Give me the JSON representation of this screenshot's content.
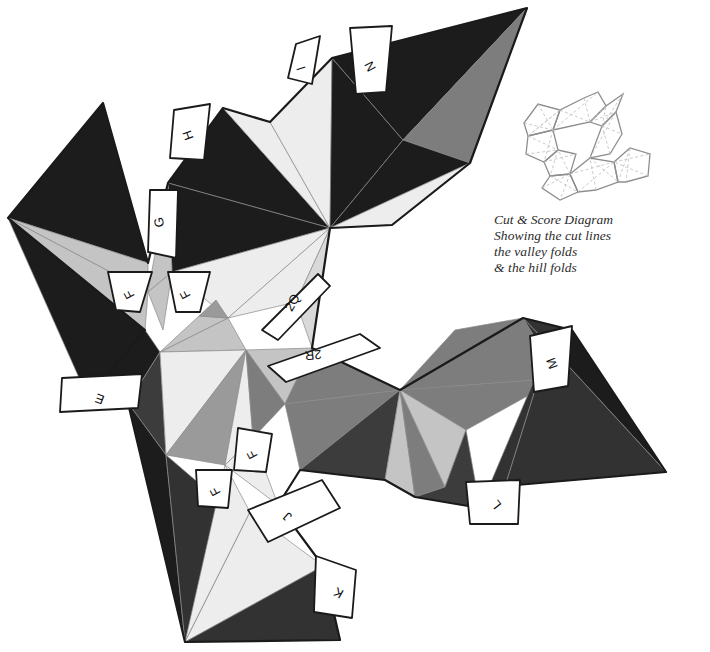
{
  "document": {
    "kind": "papercraft-net",
    "title": "Cut & Score Diagram"
  },
  "legend": {
    "title": "Cut & Score Diagram",
    "rows": [
      {
        "label": "Showing the cut lines",
        "rule": "solid-dark"
      },
      {
        "label": "the valley folds",
        "rule": "dashed-light"
      },
      {
        "label": "& the hill folds",
        "rule": "solid-light"
      }
    ]
  },
  "thumbnail": {
    "name": "mini-net-preview",
    "caption": ""
  },
  "palette": {
    "black": "#1c1c1c",
    "dark": "#323232",
    "darkgray": "#3c3c3c",
    "mid": "#7d7d7d",
    "midlight": "#9a9a9a",
    "light": "#c4c4c4",
    "lighter": "#d9d9d9",
    "paleer": "#ededed",
    "white": "#ffffff",
    "stroke_cut": "#1a1a1a",
    "stroke_fold": "#6e6e6e",
    "stroke_thin": "#8a8a8a",
    "text": "#111111"
  },
  "tabs": [
    {
      "id": "tab-i",
      "label": "I",
      "x": 302,
      "y": 68,
      "rot": -108
    },
    {
      "id": "tab-n",
      "label": "N",
      "x": 371,
      "y": 66,
      "rot": -118
    },
    {
      "id": "tab-h",
      "label": "H",
      "x": 189,
      "y": 135,
      "rot": -110
    },
    {
      "id": "tab-g",
      "label": "G",
      "x": 160,
      "y": 222,
      "rot": -100
    },
    {
      "id": "tab-f1",
      "label": "F",
      "x": 130,
      "y": 294,
      "rot": -118
    },
    {
      "id": "tab-f2",
      "label": "F",
      "x": 186,
      "y": 294,
      "rot": -118
    },
    {
      "id": "tab-e",
      "label": "E",
      "x": 100,
      "y": 398,
      "rot": -160
    },
    {
      "id": "tab-2q",
      "label": "2Q",
      "x": 293,
      "y": 303,
      "rot": -60
    },
    {
      "id": "tab-2r",
      "label": "2R",
      "x": 313,
      "y": 354,
      "rot": -186
    },
    {
      "id": "tab-f3",
      "label": "F",
      "x": 253,
      "y": 454,
      "rot": -118
    },
    {
      "id": "tab-f4",
      "label": "F",
      "x": 216,
      "y": 491,
      "rot": -118
    },
    {
      "id": "tab-j",
      "label": "J",
      "x": 288,
      "y": 516,
      "rot": -140
    },
    {
      "id": "tab-k",
      "label": "K",
      "x": 339,
      "y": 592,
      "rot": -150
    },
    {
      "id": "tab-m",
      "label": "M",
      "x": 553,
      "y": 363,
      "rot": -110
    },
    {
      "id": "tab-l",
      "label": "L",
      "x": 497,
      "y": 504,
      "rot": -128
    }
  ],
  "facets": [
    {
      "id": "f01",
      "tone": "black",
      "points": "8,218 103,103 148,263 8,218"
    },
    {
      "id": "f02",
      "tone": "light",
      "points": "8,218 148,263 148,292 8,218"
    },
    {
      "id": "f03",
      "tone": "light",
      "points": "8,218 148,292 145,330 8,218"
    },
    {
      "id": "f04",
      "tone": "black",
      "points": "8,218 145,330 88,398 8,218"
    },
    {
      "id": "f05",
      "tone": "black",
      "points": "88,398 145,330 160,352 128,403 88,398"
    },
    {
      "id": "f06",
      "tone": "darkgray",
      "points": "128,403 160,352 166,455 128,403"
    },
    {
      "id": "f07",
      "tone": "black",
      "points": "128,403 166,455 185,642 128,403"
    },
    {
      "id": "f08",
      "tone": "dark",
      "points": "166,455 185,642 265,540 166,455"
    },
    {
      "id": "f10",
      "tone": "black",
      "points": "223,108 330,228 168,183 223,108"
    },
    {
      "id": "f11",
      "tone": "paleer",
      "points": "223,108 330,228 270,122 223,108"
    },
    {
      "id": "f12",
      "tone": "paleer",
      "points": "270,122 330,228 332,58 270,122"
    },
    {
      "id": "f13",
      "tone": "black",
      "points": "332,58 330,228 403,140 332,58"
    },
    {
      "id": "f14",
      "tone": "black",
      "points": "168,183 330,228 172,272 168,183"
    },
    {
      "id": "f15",
      "tone": "paleer",
      "points": "172,272 330,228 228,318 172,272"
    },
    {
      "id": "f16",
      "tone": "paleer",
      "points": "228,318 330,228 296,302 228,318"
    },
    {
      "id": "f17",
      "tone": "lighter",
      "points": "296,302 330,228 312,348 296,302"
    },
    {
      "id": "f20",
      "tone": "black",
      "points": "403,140 332,58 527,8 403,140"
    },
    {
      "id": "f21",
      "tone": "mid",
      "points": "403,140 527,8 470,163 403,140"
    },
    {
      "id": "f22",
      "tone": "black",
      "points": "403,140 470,163 330,228 403,140"
    },
    {
      "id": "f23",
      "tone": "paleer",
      "points": "330,228 470,163 392,225 330,228"
    },
    {
      "id": "f30",
      "tone": "light",
      "points": "168,183 172,272 148,292 168,183"
    },
    {
      "id": "f31",
      "tone": "light",
      "points": "148,292 172,272 163,330 148,292"
    },
    {
      "id": "f40",
      "tone": "light",
      "points": "160,352 228,318 246,350 160,352"
    },
    {
      "id": "f41",
      "tone": "paleer",
      "points": "160,352 246,350 166,455 160,352"
    },
    {
      "id": "f42",
      "tone": "midlight",
      "points": "166,455 246,350 225,465 166,455"
    },
    {
      "id": "f43",
      "tone": "paleer",
      "points": "225,465 246,350 253,438 225,465"
    },
    {
      "id": "f44",
      "tone": "light",
      "points": "160,352 228,318 199,316 160,352"
    },
    {
      "id": "f45",
      "tone": "midlight",
      "points": "199,316 228,318 216,300 199,316"
    },
    {
      "id": "f50",
      "tone": "light",
      "points": "246,350 312,348 285,404 246,350"
    },
    {
      "id": "f51",
      "tone": "mid",
      "points": "246,350 285,404 253,438 246,350"
    },
    {
      "id": "f52",
      "tone": "mid",
      "points": "285,404 312,348 400,390 285,404"
    },
    {
      "id": "f53",
      "tone": "mid",
      "points": "285,404 400,390 300,470 285,404"
    },
    {
      "id": "f54",
      "tone": "darkgray",
      "points": "300,470 400,390 385,480 300,470"
    },
    {
      "id": "f60",
      "tone": "paleer",
      "points": "225,465 253,438 278,505 225,465"
    },
    {
      "id": "f61",
      "tone": "paleer",
      "points": "185,642 225,465 250,512 185,642"
    },
    {
      "id": "f62",
      "tone": "paleer",
      "points": "185,642 250,512 323,566 185,642"
    },
    {
      "id": "f63",
      "tone": "dark",
      "points": "185,642 323,566 340,640 185,642"
    },
    {
      "id": "f70",
      "tone": "light",
      "points": "400,390 523,318 440,368 400,390"
    },
    {
      "id": "f71",
      "tone": "light",
      "points": "400,390 440,368 466,430 400,390"
    },
    {
      "id": "f72",
      "tone": "mid",
      "points": "400,390 466,430 560,378 400,390"
    },
    {
      "id": "f73",
      "tone": "mid",
      "points": "400,390 560,378 523,318 400,390"
    },
    {
      "id": "f74",
      "tone": "mid",
      "points": "400,390 523,318 455,330 400,390"
    },
    {
      "id": "f80",
      "tone": "light",
      "points": "400,390 385,480 415,497 400,390"
    },
    {
      "id": "f81",
      "tone": "mid",
      "points": "400,390 415,497 445,487 400,390"
    },
    {
      "id": "f82",
      "tone": "light",
      "points": "400,390 445,487 466,430 400,390"
    },
    {
      "id": "f83",
      "tone": "darkgray",
      "points": "415,497 445,487 466,430 480,508 415,497"
    },
    {
      "id": "f90",
      "tone": "dark",
      "points": "560,378 523,318 549,345 560,378"
    },
    {
      "id": "f91",
      "tone": "dark",
      "points": "549,345 523,318 572,330 549,345"
    },
    {
      "id": "f92",
      "tone": "black",
      "points": "549,345 572,330 666,472 549,345"
    },
    {
      "id": "f93",
      "tone": "dark",
      "points": "549,345 666,472 505,486 549,345"
    },
    {
      "id": "f94",
      "tone": "dark",
      "points": "549,345 505,486 480,508 549,345"
    }
  ]
}
